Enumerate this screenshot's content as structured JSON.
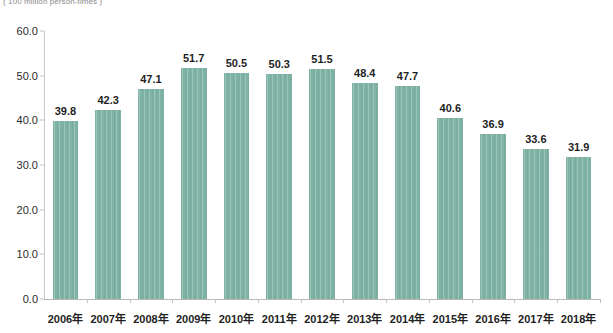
{
  "caption": {
    "unit_label": "( 100 million person-times )"
  },
  "style": {
    "bar_color": "#7fb3a6",
    "axis_color": "#c2c2c2",
    "label_color": "#1f1f1f",
    "caption_color": "#8a8a8a",
    "background": "#ffffff"
  },
  "chart_data": {
    "type": "bar",
    "title": "",
    "subtitle": "",
    "xlabel": "",
    "ylabel": "( 100 million person-times )",
    "categories": [
      "2006年",
      "2007年",
      "2008年",
      "2009年",
      "2010年",
      "2011年",
      "2012年",
      "2013年",
      "2014年",
      "2015年",
      "2016年",
      "2017年",
      "2018年"
    ],
    "values": [
      39.8,
      42.3,
      47.1,
      51.7,
      50.5,
      50.3,
      51.5,
      48.4,
      47.7,
      40.6,
      36.9,
      33.6,
      31.9
    ],
    "data_labels": [
      "39.8",
      "42.3",
      "47.1",
      "51.7",
      "50.5",
      "50.3",
      "51.5",
      "48.4",
      "47.7",
      "40.6",
      "36.9",
      "33.6",
      "31.9"
    ],
    "ylim": [
      0.0,
      60.0
    ],
    "ytick_step": 10.0,
    "ytick_labels": [
      "0.0",
      "10.0",
      "20.0",
      "30.0",
      "40.0",
      "50.0",
      "60.0"
    ],
    "ytick_values": [
      0.0,
      10.0,
      20.0,
      30.0,
      40.0,
      50.0,
      60.0
    ],
    "grid": false,
    "legend": false,
    "legend_position": "none",
    "series": [
      {
        "name": "",
        "values": [
          39.8,
          42.3,
          47.1,
          51.7,
          50.5,
          50.3,
          51.5,
          48.4,
          47.7,
          40.6,
          36.9,
          33.6,
          31.9
        ]
      }
    ]
  }
}
